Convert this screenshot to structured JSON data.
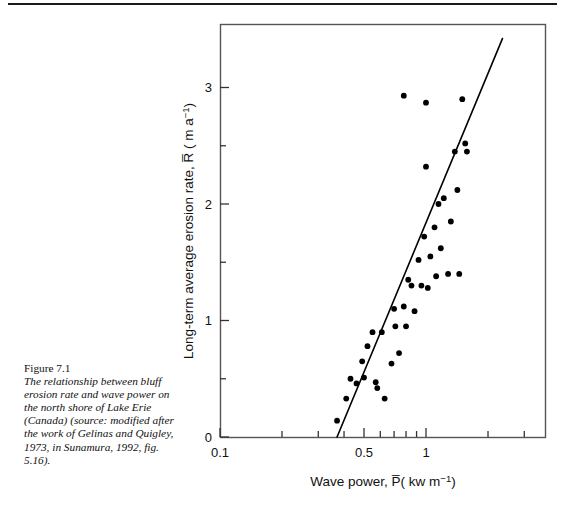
{
  "page": {
    "top_rule": true,
    "background_color": "#ffffff",
    "ink_color": "#111111"
  },
  "caption": {
    "label": "Figure 7.1",
    "text": "The relationship between bluff erosion rate and wave power on the north shore of Lake Erie (Canada) (source: modified after the work of Gelinas and Quigley, 1973, in Sunamura, 1992, fig. 5.16)."
  },
  "chart_data": {
    "type": "scatter",
    "title": "",
    "xlabel": "Wave power, P̄( kw m⁻¹)",
    "ylabel": "Long-term average erosion rate, R̄ ( m a⁻¹)",
    "xscale": "log",
    "yscale": "linear",
    "xlim": [
      0.1,
      4.0
    ],
    "ylim": [
      0,
      3.5
    ],
    "grid": false,
    "legend": null,
    "x_tick_labels": [
      "0.1",
      "0.5",
      "1"
    ],
    "x_tick_label_values": [
      0.1,
      0.5,
      1
    ],
    "x_minor_ticks": [
      0.2,
      0.3,
      0.4,
      0.6,
      0.7,
      0.8,
      0.9,
      2,
      3
    ],
    "y_tick_labels": [
      "0",
      "1",
      "2",
      "3"
    ],
    "y_tick_label_values": [
      0,
      1,
      2,
      3
    ],
    "y_minor_ticks": [
      0.5,
      1.5,
      2.5
    ],
    "marker": "filled-circle",
    "marker_color": "#000000",
    "marker_size_px": 5,
    "points": [
      [
        0.37,
        0.14
      ],
      [
        0.41,
        0.33
      ],
      [
        0.43,
        0.5
      ],
      [
        0.46,
        0.46
      ],
      [
        0.49,
        0.65
      ],
      [
        0.55,
        0.9
      ],
      [
        0.57,
        0.47
      ],
      [
        0.58,
        0.42
      ],
      [
        0.5,
        0.51
      ],
      [
        0.52,
        0.78
      ],
      [
        0.61,
        0.9
      ],
      [
        0.63,
        0.33
      ],
      [
        0.68,
        0.63
      ],
      [
        0.7,
        1.1
      ],
      [
        0.71,
        0.95
      ],
      [
        0.74,
        0.72
      ],
      [
        0.78,
        1.12
      ],
      [
        0.8,
        0.95
      ],
      [
        0.82,
        1.35
      ],
      [
        0.85,
        1.3
      ],
      [
        0.88,
        1.08
      ],
      [
        0.92,
        1.52
      ],
      [
        0.95,
        1.3
      ],
      [
        0.98,
        1.72
      ],
      [
        1.0,
        2.32
      ],
      [
        1.02,
        1.28
      ],
      [
        1.05,
        1.55
      ],
      [
        1.1,
        1.8
      ],
      [
        1.12,
        1.38
      ],
      [
        1.15,
        2.0
      ],
      [
        1.18,
        1.62
      ],
      [
        1.22,
        2.05
      ],
      [
        1.28,
        1.4
      ],
      [
        1.32,
        1.85
      ],
      [
        1.38,
        2.45
      ],
      [
        1.42,
        2.12
      ],
      [
        1.45,
        1.4
      ],
      [
        1.0,
        2.87
      ],
      [
        0.78,
        2.93
      ],
      [
        1.5,
        2.9
      ],
      [
        1.55,
        2.52
      ],
      [
        1.58,
        2.45
      ]
    ],
    "trend_line": {
      "style": "solid",
      "color": "#000000",
      "width_px": 1.6,
      "x_start": 0.37,
      "y_start": 0.0,
      "x_end": 2.35,
      "y_end": 3.42
    }
  }
}
